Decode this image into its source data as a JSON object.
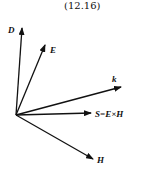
{
  "equation_number": "(12.16)",
  "diagram": {
    "origin": [
      16,
      115
    ],
    "vectors": [
      {
        "name": "D",
        "label": "D",
        "tip": [
          22,
          28
        ],
        "label_pos": [
          8,
          33
        ]
      },
      {
        "name": "E",
        "label": "E",
        "tip": [
          45,
          45
        ],
        "label_pos": [
          50,
          53
        ]
      },
      {
        "name": "k",
        "label": "k",
        "tip": [
          121,
          87
        ],
        "label_pos": [
          112,
          82
        ]
      },
      {
        "name": "S",
        "label": "S=E×H",
        "tip": [
          91,
          113
        ],
        "label_pos": [
          95,
          117
        ]
      },
      {
        "name": "H",
        "label": "H",
        "tip": [
          93,
          159
        ],
        "label_pos": [
          97,
          163
        ]
      }
    ],
    "line_color": "#111111"
  }
}
